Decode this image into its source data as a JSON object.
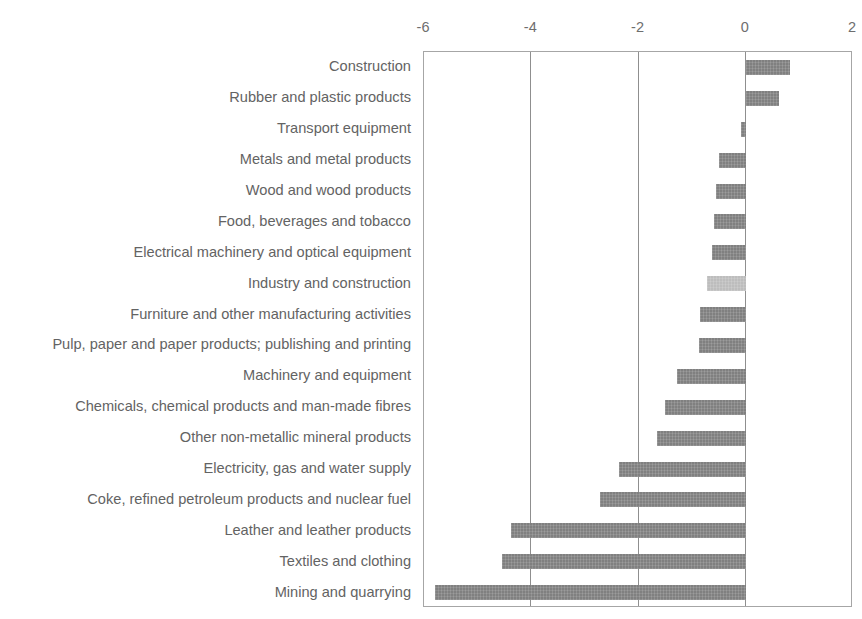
{
  "figure": {
    "cutoff_text": "",
    "bar_color": "#808080",
    "highlight_color": "#bdbdbd",
    "axis_line_color": "#a6a6a6",
    "gridline_color": "#8f8f8f",
    "text_color": "#636363"
  },
  "chart_data": {
    "type": "bar",
    "orientation": "horizontal",
    "title": "",
    "xlabel": "",
    "ylabel": "",
    "xlim": [
      -6,
      2
    ],
    "xticks": [
      -6,
      -4,
      -2,
      0,
      2
    ],
    "xticklabels": [
      "-6",
      "-4",
      "-2",
      "0",
      "2"
    ],
    "grid": true,
    "legend": null,
    "highlight_category": "Industry and construction",
    "categories": [
      "Construction",
      "Rubber and plastic products",
      "Transport equipment",
      "Metals and metal products",
      "Wood and wood products",
      "Food, beverages and tobacco",
      "Electrical machinery and optical equipment",
      "Industry and construction",
      "Furniture and other manufacturing activities",
      "Pulp, paper and paper products; publishing and printing",
      "Machinery and equipment",
      "Chemicals, chemical products and man-made fibres",
      "Other non-metallic mineral products",
      "Electricity, gas and water supply",
      "Coke, refined petroleum products and nuclear fuel",
      "Leather and leather products",
      "Textiles and clothing",
      "Mining and quarrying"
    ],
    "values": [
      0.83,
      0.62,
      -0.08,
      -0.49,
      -0.56,
      -0.6,
      -0.63,
      -0.73,
      -0.85,
      -0.88,
      -1.29,
      -1.5,
      -1.65,
      -2.37,
      -2.71,
      -4.37,
      -4.54,
      -5.79
    ]
  }
}
